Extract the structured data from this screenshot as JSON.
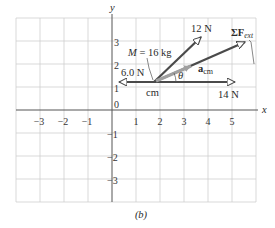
{
  "figure": {
    "caption": "(b)",
    "axis_labels": {
      "x": "x",
      "y": "y"
    },
    "x_ticks": [
      "−3",
      "−2",
      "−1",
      "1",
      "2",
      "3",
      "4",
      "5"
    ],
    "y_ticks": [
      "3",
      "2",
      "1",
      "0",
      "−1",
      "−2",
      "−3"
    ],
    "mass_label": "M = 16 kg",
    "cm_label": "cm",
    "angle_label": "θ",
    "vectors": [
      {
        "name": "force-6N",
        "label": "6.0 N",
        "from": [
          1.75,
          1.2
        ],
        "to": [
          0.3,
          1.2
        ]
      },
      {
        "name": "force-14N",
        "label": "14 N",
        "from": [
          1.75,
          1.2
        ],
        "to": [
          5.1,
          1.2
        ]
      },
      {
        "name": "force-12N",
        "label": "12 N",
        "from": [
          1.75,
          1.2
        ],
        "to": [
          3.7,
          3.2
        ]
      },
      {
        "name": "net-external-force",
        "label_main": "ΣF",
        "label_sub": "ext",
        "from": [
          1.75,
          1.2
        ],
        "to": [
          5.5,
          3.0
        ]
      },
      {
        "name": "acceleration-cm",
        "label_main": "a",
        "label_sub": "cm",
        "from": [
          1.75,
          1.2
        ],
        "to": [
          3.5,
          2.0
        ]
      }
    ],
    "grid": {
      "x_range": [
        -4,
        6
      ],
      "y_range": [
        -4,
        4
      ]
    },
    "colors": {
      "vector": "#4a4a4a",
      "acceleration": "#a0a0a0",
      "grid": "#cfcfcf",
      "axis": "#555555"
    }
  }
}
